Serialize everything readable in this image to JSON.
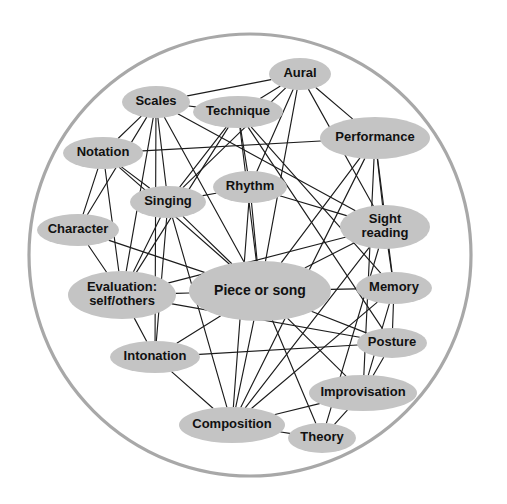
{
  "diagram": {
    "type": "node-link-network",
    "boundary": {
      "shape": "circle",
      "cx": 250,
      "cy": 255,
      "r": 221,
      "stroke_color": "#a8a8a8",
      "fill_color": "#ffffff"
    },
    "style": {
      "node_fill": "#c4c4c4",
      "node_text_color": "#111111",
      "edge_color": "#1c1c1c",
      "background": "#ffffff"
    },
    "nodes": [
      {
        "id": "aural",
        "label": "Aural",
        "cx": 300,
        "cy": 74,
        "rx": 31,
        "ry": 16,
        "font_size": 13
      },
      {
        "id": "scales",
        "label": "Scales",
        "cx": 156,
        "cy": 102,
        "rx": 34,
        "ry": 16,
        "font_size": 13
      },
      {
        "id": "technique",
        "label": "Technique",
        "cx": 238,
        "cy": 112,
        "rx": 45,
        "ry": 16,
        "font_size": 13
      },
      {
        "id": "performance",
        "label": "Performance",
        "cx": 375,
        "cy": 138,
        "rx": 55,
        "ry": 21,
        "font_size": 13
      },
      {
        "id": "notation",
        "label": "Notation",
        "cx": 103,
        "cy": 153,
        "rx": 40,
        "ry": 16,
        "font_size": 13
      },
      {
        "id": "rhythm",
        "label": "Rhythm",
        "cx": 250,
        "cy": 187,
        "rx": 37,
        "ry": 16,
        "font_size": 13
      },
      {
        "id": "singing",
        "label": "Singing",
        "cx": 168,
        "cy": 202,
        "rx": 38,
        "ry": 16,
        "font_size": 13
      },
      {
        "id": "character",
        "label": "Character",
        "cx": 78,
        "cy": 230,
        "rx": 41,
        "ry": 16,
        "font_size": 13
      },
      {
        "id": "sight",
        "label": "Sight reading",
        "line1": "Sight",
        "line2": "reading",
        "cx": 385,
        "cy": 227,
        "rx": 45,
        "ry": 22,
        "font_size": 13
      },
      {
        "id": "evaluation",
        "label": "Evaluation: self/others",
        "line1": "Evaluation:",
        "line2": "self/others",
        "cx": 122,
        "cy": 295,
        "rx": 54,
        "ry": 24,
        "font_size": 13
      },
      {
        "id": "piece",
        "label": "Piece or song",
        "cx": 260,
        "cy": 291,
        "rx": 71,
        "ry": 30,
        "font_size": 14
      },
      {
        "id": "memory",
        "label": "Memory",
        "cx": 394,
        "cy": 288,
        "rx": 38,
        "ry": 16,
        "font_size": 13
      },
      {
        "id": "posture",
        "label": "Posture",
        "cx": 392,
        "cy": 343,
        "rx": 35,
        "ry": 15,
        "font_size": 13
      },
      {
        "id": "intonation",
        "label": "Intonation",
        "cx": 155,
        "cy": 357,
        "rx": 45,
        "ry": 16,
        "font_size": 13
      },
      {
        "id": "improvisation",
        "label": "Improvisation",
        "cx": 363,
        "cy": 393,
        "rx": 54,
        "ry": 18,
        "font_size": 13
      },
      {
        "id": "composition",
        "label": "Composition",
        "cx": 232,
        "cy": 425,
        "rx": 53,
        "ry": 18,
        "font_size": 13
      },
      {
        "id": "theory",
        "label": "Theory",
        "cx": 322,
        "cy": 438,
        "rx": 34,
        "ry": 15,
        "font_size": 13
      }
    ],
    "edges": [
      [
        "aural",
        "scales"
      ],
      [
        "aural",
        "technique"
      ],
      [
        "aural",
        "singing"
      ],
      [
        "aural",
        "rhythm"
      ],
      [
        "aural",
        "performance"
      ],
      [
        "aural",
        "piece"
      ],
      [
        "aural",
        "sight"
      ],
      [
        "scales",
        "technique"
      ],
      [
        "scales",
        "notation"
      ],
      [
        "scales",
        "singing"
      ],
      [
        "scales",
        "evaluation"
      ],
      [
        "scales",
        "character"
      ],
      [
        "scales",
        "piece"
      ],
      [
        "scales",
        "intonation"
      ],
      [
        "scales",
        "sight"
      ],
      [
        "technique",
        "rhythm"
      ],
      [
        "technique",
        "singing"
      ],
      [
        "technique",
        "piece"
      ],
      [
        "technique",
        "evaluation"
      ],
      [
        "technique",
        "posture"
      ],
      [
        "technique",
        "memory"
      ],
      [
        "performance",
        "notation"
      ],
      [
        "performance",
        "sight"
      ],
      [
        "performance",
        "memory"
      ],
      [
        "performance",
        "piece"
      ],
      [
        "performance",
        "improvisation"
      ],
      [
        "performance",
        "composition"
      ],
      [
        "notation",
        "character"
      ],
      [
        "notation",
        "evaluation"
      ],
      [
        "notation",
        "singing"
      ],
      [
        "notation",
        "piece"
      ],
      [
        "rhythm",
        "singing"
      ],
      [
        "rhythm",
        "piece"
      ],
      [
        "rhythm",
        "sight"
      ],
      [
        "rhythm",
        "composition"
      ],
      [
        "singing",
        "piece"
      ],
      [
        "singing",
        "evaluation"
      ],
      [
        "singing",
        "intonation"
      ],
      [
        "singing",
        "composition"
      ],
      [
        "character",
        "evaluation"
      ],
      [
        "character",
        "piece"
      ],
      [
        "sight",
        "piece"
      ],
      [
        "sight",
        "memory"
      ],
      [
        "sight",
        "evaluation"
      ],
      [
        "sight",
        "composition"
      ],
      [
        "sight",
        "theory"
      ],
      [
        "evaluation",
        "piece"
      ],
      [
        "evaluation",
        "intonation"
      ],
      [
        "evaluation",
        "posture"
      ],
      [
        "piece",
        "memory"
      ],
      [
        "piece",
        "posture"
      ],
      [
        "piece",
        "intonation"
      ],
      [
        "piece",
        "improvisation"
      ],
      [
        "piece",
        "composition"
      ],
      [
        "piece",
        "theory"
      ],
      [
        "memory",
        "improvisation"
      ],
      [
        "memory",
        "posture"
      ],
      [
        "memory",
        "composition"
      ],
      [
        "posture",
        "intonation"
      ],
      [
        "posture",
        "improvisation"
      ],
      [
        "intonation",
        "composition"
      ],
      [
        "improvisation",
        "theory"
      ],
      [
        "improvisation",
        "composition"
      ],
      [
        "composition",
        "theory"
      ]
    ]
  }
}
